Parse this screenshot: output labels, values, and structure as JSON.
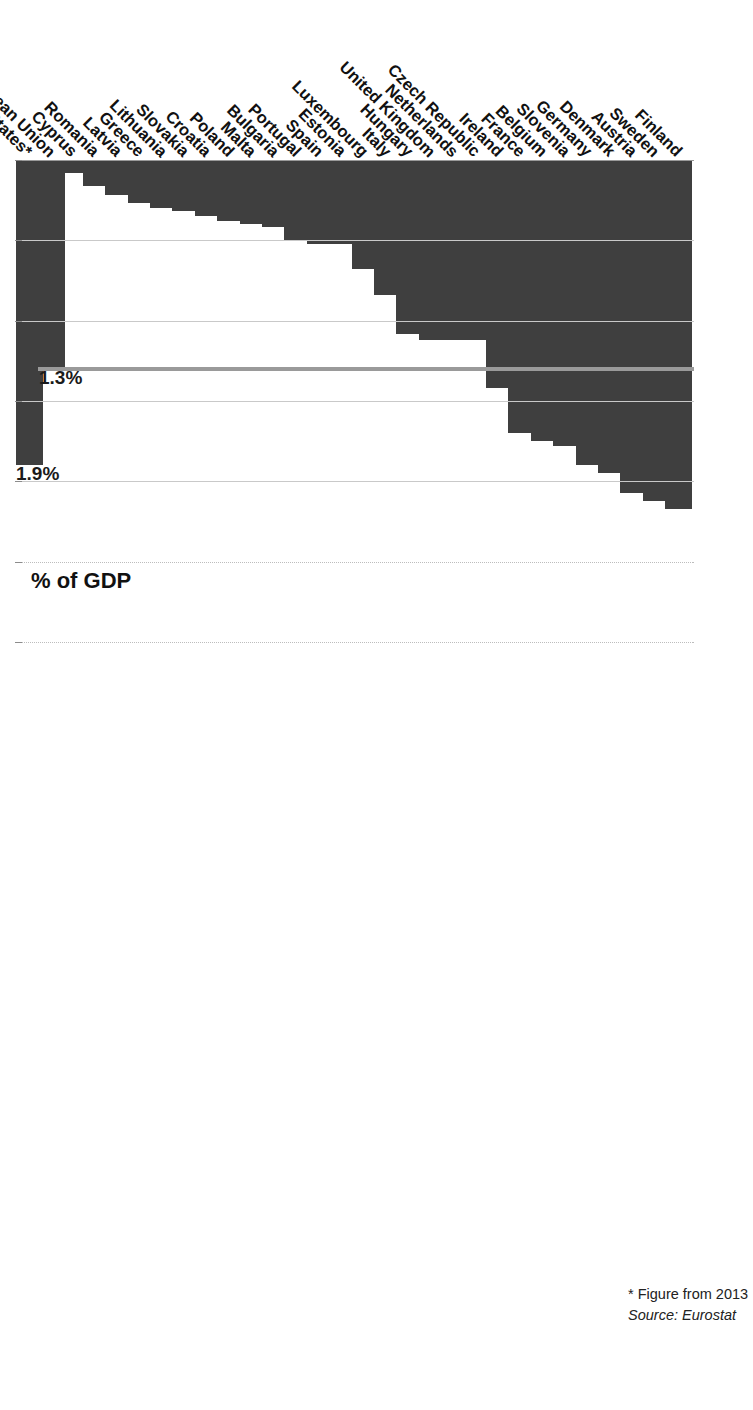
{
  "chart_data": {
    "type": "bar",
    "orientation": "horizontal",
    "title": "",
    "xlabel": "% of GDP",
    "ylabel": "",
    "xlim": [
      0.0,
      3.0
    ],
    "xticks": [
      "0.0%",
      "0.5%",
      "1.0%",
      "1.5%",
      "2.0%",
      "2.5%",
      "3.0%"
    ],
    "xtick_values": [
      0.0,
      0.5,
      1.0,
      1.5,
      2.0,
      2.5,
      3.0
    ],
    "grid": true,
    "legend": "none",
    "categories": [
      "Finland",
      "Sweden",
      "Austria",
      "Denmark",
      "Germany",
      "Slovenia",
      "Belgium",
      "France",
      "Ireland",
      "Czech Republic",
      "Netherlands",
      "United Kingdom",
      "Hungary",
      "Italy",
      "Luxembourg",
      "Estonia",
      "Spain",
      "Portugal",
      "Bulgaria",
      "Malta",
      "Poland",
      "Croatia",
      "Slovakia",
      "Lithuania",
      "Greece",
      "Latvia",
      "Romania",
      "Cyprus",
      "European Union",
      "United States*"
    ],
    "values": [
      2.17,
      2.12,
      2.07,
      1.95,
      1.9,
      1.78,
      1.75,
      1.7,
      1.42,
      1.12,
      1.12,
      1.12,
      1.08,
      0.84,
      0.68,
      0.52,
      0.52,
      0.5,
      0.42,
      0.4,
      0.38,
      0.35,
      0.32,
      0.3,
      0.27,
      0.22,
      0.16,
      0.08,
      1.3,
      1.9
    ],
    "value_labels": {
      "European Union": "1.3%",
      "United States*": "1.9%"
    },
    "reference_line": {
      "label": "1.3%",
      "value": 1.3,
      "color": "#9a9a9a"
    },
    "bar_color": "#3f3f3f",
    "gridline_color": "#c9c9c9",
    "axis_color": "#8c8c8c"
  },
  "footnotes": {
    "note": "* Figure from 2013",
    "source": "Source: Eurostat"
  }
}
